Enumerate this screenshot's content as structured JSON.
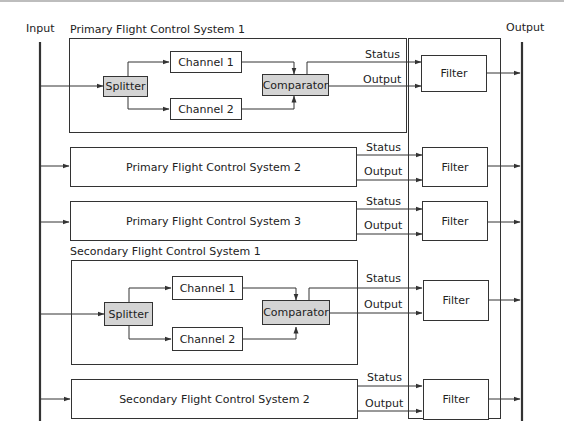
{
  "diagram": {
    "input_label": "Input",
    "output_label": "Output",
    "systems": [
      {
        "title": "Primary Flight Control System 1",
        "type": "detailed",
        "splitter": "Splitter",
        "channels": [
          "Channel 1",
          "Channel 2"
        ],
        "comparator": "Comparator",
        "status_label": "Status",
        "output_label": "Output",
        "filter": "Filter"
      },
      {
        "title": "Primary Flight Control System 2",
        "type": "simple",
        "status_label": "Status",
        "output_label": "Output",
        "filter": "Filter"
      },
      {
        "title": "Primary Flight Control System 3",
        "type": "simple",
        "status_label": "Status",
        "output_label": "Output",
        "filter": "Filter"
      },
      {
        "title": "Secondary Flight Control System 1",
        "type": "detailed",
        "splitter": "Splitter",
        "channels": [
          "Channel 1",
          "Channel 2"
        ],
        "comparator": "Comparator",
        "status_label": "Status",
        "output_label": "Output",
        "filter": "Filter"
      },
      {
        "title": "Secondary Flight Control System 2",
        "type": "simple",
        "status_label": "Status",
        "output_label": "Output",
        "filter": "Filter"
      }
    ],
    "colors": {
      "line": "#333333",
      "highlight_box": "#d4d4d4",
      "background": "#ffffff"
    }
  }
}
